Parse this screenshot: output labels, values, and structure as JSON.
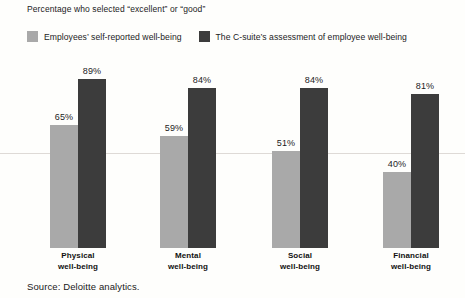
{
  "chart_data": {
    "type": "bar",
    "title": "Percentage who selected “excellent” or “good”",
    "subtitle": "",
    "xlabel": "",
    "ylabel": "",
    "ylim": [
      0,
      100
    ],
    "grid": true,
    "gridlines_at": [
      50
    ],
    "legend_position": "top-left",
    "categories": [
      "Physical\nwell-being",
      "Mental\nwell-being",
      "Social\nwell-being",
      "Financial\nwell-being"
    ],
    "category_lines": [
      [
        "Physical",
        "well-being"
      ],
      [
        "Mental",
        "well-being"
      ],
      [
        "Social",
        "well-being"
      ],
      [
        "Financial",
        "well-being"
      ]
    ],
    "series": [
      {
        "name": "Employees’ self-reported well-being",
        "color": "#a9a9a9",
        "values": [
          65,
          59,
          51,
          40
        ],
        "labels": [
          "65%",
          "59%",
          "51%",
          "40%"
        ]
      },
      {
        "name": "The C-suite’s assessment of employee well-being",
        "color": "#3c3c3c",
        "values": [
          89,
          84,
          84,
          81
        ],
        "labels": [
          "89%",
          "84%",
          "84%",
          "81%"
        ]
      }
    ],
    "source": "Source: Deloitte analytics."
  },
  "legend": {
    "items": [
      {
        "label": "Employees’ self-reported well-being",
        "color": "#a9a9a9"
      },
      {
        "label": "The C-suite’s assessment of employee well-being",
        "color": "#3c3c3c"
      }
    ]
  },
  "colors": {
    "series_self": "#a9a9a9",
    "series_csuite": "#3c3c3c",
    "background": "#fefefc",
    "gridline": "#dedad6",
    "text": "#1a1a1a"
  },
  "footer": {
    "source": "Source: Deloitte analytics."
  }
}
